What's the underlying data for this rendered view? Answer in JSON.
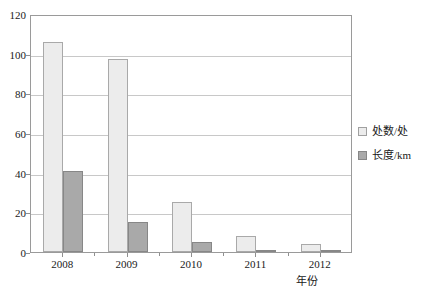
{
  "chart_data": {
    "type": "bar",
    "title": "",
    "xlabel": "年份",
    "ylabel": "",
    "categories": [
      "2008",
      "2009",
      "2010",
      "2011",
      "2012"
    ],
    "series": [
      {
        "name": "处数/处",
        "values": [
          106,
          97.5,
          25,
          8,
          4
        ],
        "color": "#ececec"
      },
      {
        "name": "长度/km",
        "values": [
          41,
          15,
          5,
          1,
          0.5
        ],
        "color": "#a9a9a9"
      }
    ],
    "ylim": [
      0,
      120
    ],
    "yticks": [
      0,
      20,
      40,
      60,
      80,
      100,
      120
    ],
    "ytick_labels": [
      "0",
      "20",
      "40",
      "60",
      "80",
      "100",
      "120"
    ],
    "grid": true,
    "legend_position": "right"
  },
  "legend": {
    "items": [
      {
        "label": "处数/处",
        "swatch": "light-gray-square"
      },
      {
        "label": "长度/km",
        "swatch": "dark-gray-square"
      }
    ]
  },
  "axis": {
    "x_title": "年份"
  }
}
